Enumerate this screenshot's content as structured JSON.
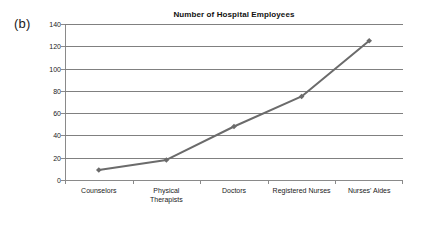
{
  "panel": {
    "letter": "(b)"
  },
  "chart_data": {
    "type": "line",
    "title": "Number of Hospital Employees",
    "xlabel": "",
    "ylabel": "",
    "categories": [
      "Counselors",
      "Physical Therapists",
      "Doctors",
      "Registered Nurses",
      "Nurses' Aides"
    ],
    "category_lines": [
      [
        "Counselors"
      ],
      [
        "Physical",
        "Therapists"
      ],
      [
        "Doctors"
      ],
      [
        "Registered Nurses"
      ],
      [
        "Nurses' Aides"
      ]
    ],
    "values": [
      9,
      18,
      48,
      75,
      125
    ],
    "ylim": [
      0,
      140
    ],
    "ytick_step": 20,
    "yticks": [
      140,
      120,
      100,
      80,
      60,
      40,
      20,
      0
    ],
    "ytick_labels": [
      "140",
      "120",
      "100",
      "80",
      "60",
      "40",
      "20",
      "0"
    ],
    "grid": true,
    "grid_axis": "y",
    "legend": false,
    "legend_position": "none",
    "marker": "diamond",
    "series_color": "#6b6b6b",
    "gridline_color": "#808080",
    "axis_color": "#8a8a8a",
    "background": "#ffffff"
  }
}
